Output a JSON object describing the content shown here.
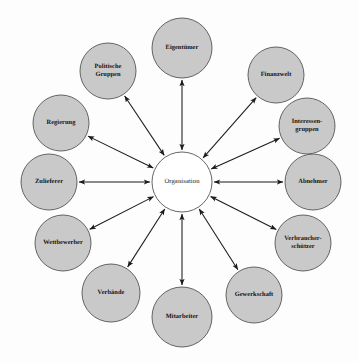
{
  "diagram": {
    "type": "hub-and-spoke-stakeholder-map",
    "background_color": "#fdfdfd",
    "node_fill_color": "#c9c9c9",
    "node_stroke_color": "#555555",
    "center_fill_color": "#ffffff",
    "edge_color": "#1a1a1a",
    "center": {
      "id": "organisation",
      "label": "Organisation",
      "cx": 182,
      "cy": 182,
      "r": 30,
      "filled": false
    },
    "satellites": [
      {
        "id": "eigentuemer",
        "label": "Eigentümer",
        "cx": 182,
        "cy": 48,
        "r": 30,
        "angle_deg": 270,
        "arrow": "double"
      },
      {
        "id": "finanzwelt",
        "label": "Finanzwelt",
        "cx": 276,
        "cy": 75,
        "r": 28,
        "angle_deg": 304,
        "arrow": "double"
      },
      {
        "id": "interessengruppen",
        "label": "Interessen-\ngruppen",
        "cx": 307,
        "cy": 126,
        "r": 28,
        "angle_deg": 330,
        "arrow": "double"
      },
      {
        "id": "abnehmer",
        "label": "Abnehmer",
        "cx": 313,
        "cy": 182,
        "r": 28,
        "angle_deg": 0,
        "arrow": "double"
      },
      {
        "id": "verbraucherschuetzer",
        "label": "Verbraucher-\nschützer",
        "cx": 303,
        "cy": 243,
        "r": 28,
        "angle_deg": 30,
        "arrow": "double"
      },
      {
        "id": "gewerkschaft",
        "label": "Gewerkschaft",
        "cx": 254,
        "cy": 295,
        "r": 28,
        "angle_deg": 58,
        "arrow": "double"
      },
      {
        "id": "mitarbeiter",
        "label": "Mitarbeiter",
        "cx": 182,
        "cy": 317,
        "r": 30,
        "angle_deg": 90,
        "arrow": "double"
      },
      {
        "id": "verbaende",
        "label": "Verbände",
        "cx": 111,
        "cy": 293,
        "r": 29,
        "angle_deg": 122,
        "arrow": "double"
      },
      {
        "id": "wettbewerber",
        "label": "Wettbewerber",
        "cx": 63,
        "cy": 243,
        "r": 28,
        "angle_deg": 150,
        "arrow": "double"
      },
      {
        "id": "zulieferer",
        "label": "Zulieferer",
        "cx": 49,
        "cy": 182,
        "r": 28,
        "angle_deg": 180,
        "arrow": "double"
      },
      {
        "id": "regierung",
        "label": "Regierung",
        "cx": 61,
        "cy": 123,
        "r": 28,
        "angle_deg": 210,
        "arrow": "double"
      },
      {
        "id": "politischegruppen",
        "label": "Politische\nGruppen",
        "cx": 108,
        "cy": 71,
        "r": 28,
        "angle_deg": 238,
        "arrow": "double"
      }
    ]
  }
}
